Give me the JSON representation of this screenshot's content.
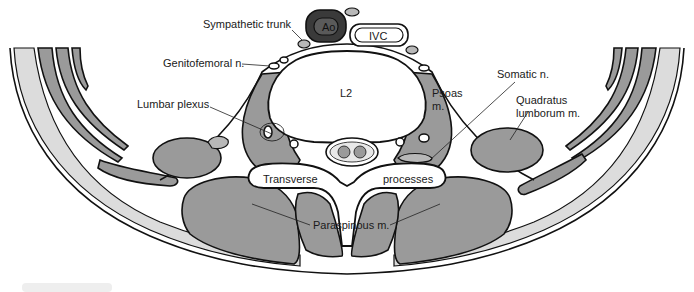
{
  "diagram": {
    "colors": {
      "muscle": "#9a9a9a",
      "fat": "#dcdcdc",
      "aorta": "#3a3a3a",
      "outline": "#111111",
      "background": "#ffffff"
    },
    "labels": {
      "sympathetic_trunk": "Sympathetic trunk",
      "aorta": "Ao",
      "ivc": "IVC",
      "genitofemoral": "Genitofemoral n.",
      "vertebra": "L2",
      "psoas_line1": "Psoas",
      "psoas_line2": "m.",
      "somatic": "Somatic n.",
      "lumbar_plexus": "Lumbar plexus",
      "quadratus_line1": "Quadratus",
      "quadratus_line2": "lumborum m.",
      "transverse": "Transverse",
      "processes": "processes",
      "paraspinous": "Paraspinous m."
    }
  }
}
